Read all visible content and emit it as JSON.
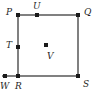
{
  "figure": {
    "type": "geometry-diagram",
    "colors": {
      "line": "#808080",
      "point": "#1a1a1a",
      "label": "#1f1f1f",
      "background": "#ffffff"
    },
    "square": {
      "left": 18,
      "top": 15,
      "right": 78,
      "bottom": 76
    },
    "edges": [
      {
        "name": "top-edge",
        "from": "P",
        "to": "Q",
        "orientation": "horizontal"
      },
      {
        "name": "right-edge",
        "from": "Q",
        "to": "S",
        "orientation": "vertical"
      },
      {
        "name": "bottom-edge",
        "from": "W",
        "to": "S",
        "orientation": "horizontal"
      },
      {
        "name": "left-edge",
        "from": "P",
        "to": "R",
        "orientation": "vertical"
      }
    ],
    "points": [
      {
        "id": "P",
        "label": "P",
        "x": 18,
        "y": 15,
        "label_x": 6,
        "label_y": 8,
        "role": "vertex-top-left"
      },
      {
        "id": "U",
        "label": "U",
        "x": 37,
        "y": 15,
        "label_x": 33,
        "label_y": 2,
        "role": "point-on-top-edge"
      },
      {
        "id": "Q",
        "label": "Q",
        "x": 78,
        "y": 15,
        "label_x": 84,
        "label_y": 8,
        "role": "vertex-top-right"
      },
      {
        "id": "T",
        "label": "T",
        "x": 18,
        "y": 47,
        "label_x": 6,
        "label_y": 41,
        "role": "point-on-left-edge"
      },
      {
        "id": "V",
        "label": "V",
        "x": 46,
        "y": 45,
        "label_x": 47,
        "label_y": 52,
        "role": "interior-point"
      },
      {
        "id": "W",
        "label": "W",
        "x": 5,
        "y": 76,
        "label_x": 1,
        "label_y": 82,
        "role": "point-on-extended-line"
      },
      {
        "id": "R",
        "label": "R",
        "x": 18,
        "y": 76,
        "label_x": 16,
        "label_y": 82,
        "role": "vertex-bottom-left"
      },
      {
        "id": "S",
        "label": "S",
        "x": 78,
        "y": 76,
        "label_x": 83,
        "label_y": 80,
        "role": "vertex-bottom-right"
      }
    ]
  }
}
